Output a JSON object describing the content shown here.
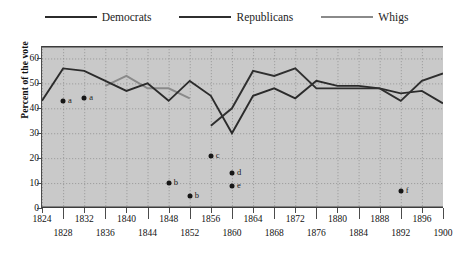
{
  "legend": {
    "position": "top-center",
    "items": [
      {
        "label": "Democrats",
        "color": "#2b2b2b"
      },
      {
        "label": "Republicans",
        "color": "#2f2f2f"
      },
      {
        "label": "Whigs",
        "color": "#8a8a8a"
      }
    ]
  },
  "axes": {
    "ylabel": "Percent of the vote",
    "yticks": [
      "0",
      "10",
      "20",
      "30",
      "40",
      "50",
      "60"
    ],
    "ylim": [
      0,
      65
    ],
    "xlim": [
      1824,
      1900
    ],
    "xticks": [
      "1824",
      "1828",
      "1832",
      "1836",
      "1840",
      "1844",
      "1848",
      "1852",
      "1856",
      "1860",
      "1864",
      "1868",
      "1872",
      "1876",
      "1880",
      "1884",
      "1888",
      "1892",
      "1896",
      "1900"
    ],
    "grid": true,
    "plot_bg": "#c9c9c9"
  },
  "chart_data": {
    "type": "line",
    "title": "",
    "xlabel": "",
    "ylabel": "Percent of the vote",
    "ylim": [
      0,
      65
    ],
    "xlim": [
      1824,
      1900
    ],
    "grid": true,
    "legend_position": "top-center",
    "series": [
      {
        "name": "Democrats",
        "color": "#2b2b2b",
        "x": [
          1824,
          1828,
          1832,
          1836,
          1840,
          1844,
          1848,
          1852,
          1856,
          1860,
          1864,
          1868,
          1872,
          1876,
          1880,
          1884,
          1888,
          1892,
          1896,
          1900
        ],
        "values": [
          43,
          56,
          55,
          51,
          47,
          50,
          43,
          51,
          45,
          30,
          45,
          48,
          44,
          51,
          49,
          49,
          48,
          46,
          47,
          42
        ]
      },
      {
        "name": "Republicans",
        "color": "#2f2f2f",
        "x": [
          1856,
          1860,
          1864,
          1868,
          1872,
          1876,
          1880,
          1884,
          1888,
          1892,
          1896,
          1900
        ],
        "values": [
          33,
          40,
          55,
          53,
          56,
          48,
          48,
          48,
          48,
          43,
          51,
          54
        ]
      },
      {
        "name": "Whigs",
        "color": "#8a8a8a",
        "x": [
          1836,
          1840,
          1844,
          1848,
          1852
        ],
        "values": [
          49,
          53,
          48,
          48,
          44
        ]
      }
    ],
    "annotated_points": [
      {
        "label": "a",
        "x": 1828,
        "y": 43
      },
      {
        "label": "a",
        "x": 1832,
        "y": 44
      },
      {
        "label": "b",
        "x": 1848,
        "y": 10
      },
      {
        "label": "b",
        "x": 1852,
        "y": 5
      },
      {
        "label": "c",
        "x": 1856,
        "y": 21
      },
      {
        "label": "d",
        "x": 1860,
        "y": 14
      },
      {
        "label": "e",
        "x": 1860,
        "y": 9
      },
      {
        "label": "f",
        "x": 1892,
        "y": 7
      }
    ]
  }
}
